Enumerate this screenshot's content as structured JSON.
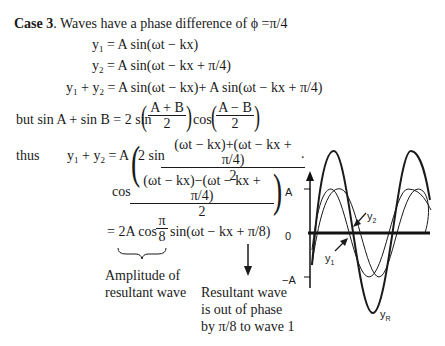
{
  "heading": {
    "case_label": "Case 3",
    "text": ". Waves have a phase difference of ϕ =π/4"
  },
  "equations": {
    "y1": {
      "lhs": "y",
      "sub": "1",
      "rhs": " = A sin(ωt − kx)"
    },
    "y2": {
      "lhs": "y",
      "sub": "2",
      "rhs": " = A sin(ωt − kx + π/4)"
    },
    "sum": {
      "lhs_a": "y",
      "sub_a": "1",
      "plus": " + y",
      "sub_b": "2",
      "rhs": " = A sin(ωt − kx)+ A sin(ωt − kx + π/4)"
    },
    "identity": {
      "prefix": "but  sin A + sin B = 2 sin",
      "frac1_num": "A + B",
      "frac1_den": "2",
      "mid": "cos",
      "frac2_num": "A − B",
      "frac2_den": "2"
    },
    "thus": {
      "label": "thus",
      "lhs_a": "y",
      "sub_a": "1",
      "plus": " + y",
      "sub_b": "2",
      "eq": " = A",
      "sin_prefix": "2 sin",
      "frac_num": "(ωt − kx)+(ωt − kx + π/4)",
      "frac_den": "2",
      "dot": ".",
      "cos_prefix": "cos",
      "frac2_num": "(ωt − kx)−(ωt − kx + π/4)",
      "frac2_den": "2"
    },
    "result": {
      "prefix": "= 2A cos",
      "frac_num": "π",
      "frac_den": "8",
      "suffix": "sin(ωt − kx + π/8)"
    }
  },
  "annotations": {
    "amplitude": [
      "Amplitude of",
      "resultant wave"
    ],
    "phase": [
      "Resultant wave",
      "is out of phase",
      "by π/8 to wave 1"
    ]
  },
  "graph": {
    "axis_labels": {
      "top": "A",
      "zero": "0",
      "bottom": "−A"
    },
    "curve_labels": {
      "y1": "y",
      "y1_sub": "1",
      "y2": "y",
      "y2_sub": "2",
      "yR": "y",
      "yR_sub": "R"
    },
    "colors": {
      "line": "#1a1a1a",
      "axis": "#111111"
    }
  }
}
